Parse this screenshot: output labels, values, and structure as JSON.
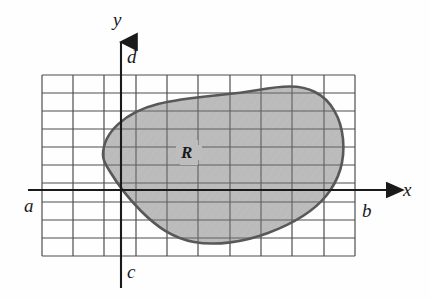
{
  "figure": {
    "kind": "math-diagram",
    "region_label": "R",
    "axis_labels": {
      "x_axis": "x",
      "y_axis": "y",
      "left_bound": "a",
      "right_bound": "b",
      "lower_bound": "c",
      "upper_bound": "d"
    },
    "colors": {
      "background": "#fefefe",
      "grid_line": "#4d4d4d",
      "axis_line": "#1a1a1a",
      "region_fill": "#b9b9b9",
      "region_outline": "#585858",
      "label_text": "#1a1a1a"
    },
    "grid": {
      "left": 42,
      "top": 75,
      "right": 355,
      "bottom": 256,
      "columns": 10,
      "rows": 10
    },
    "axes": {
      "x_axis_y": 190,
      "y_axis_x": 121,
      "x_axis_start": 28,
      "x_axis_end": 394,
      "y_axis_top": 36,
      "y_axis_bottom": 288
    }
  }
}
